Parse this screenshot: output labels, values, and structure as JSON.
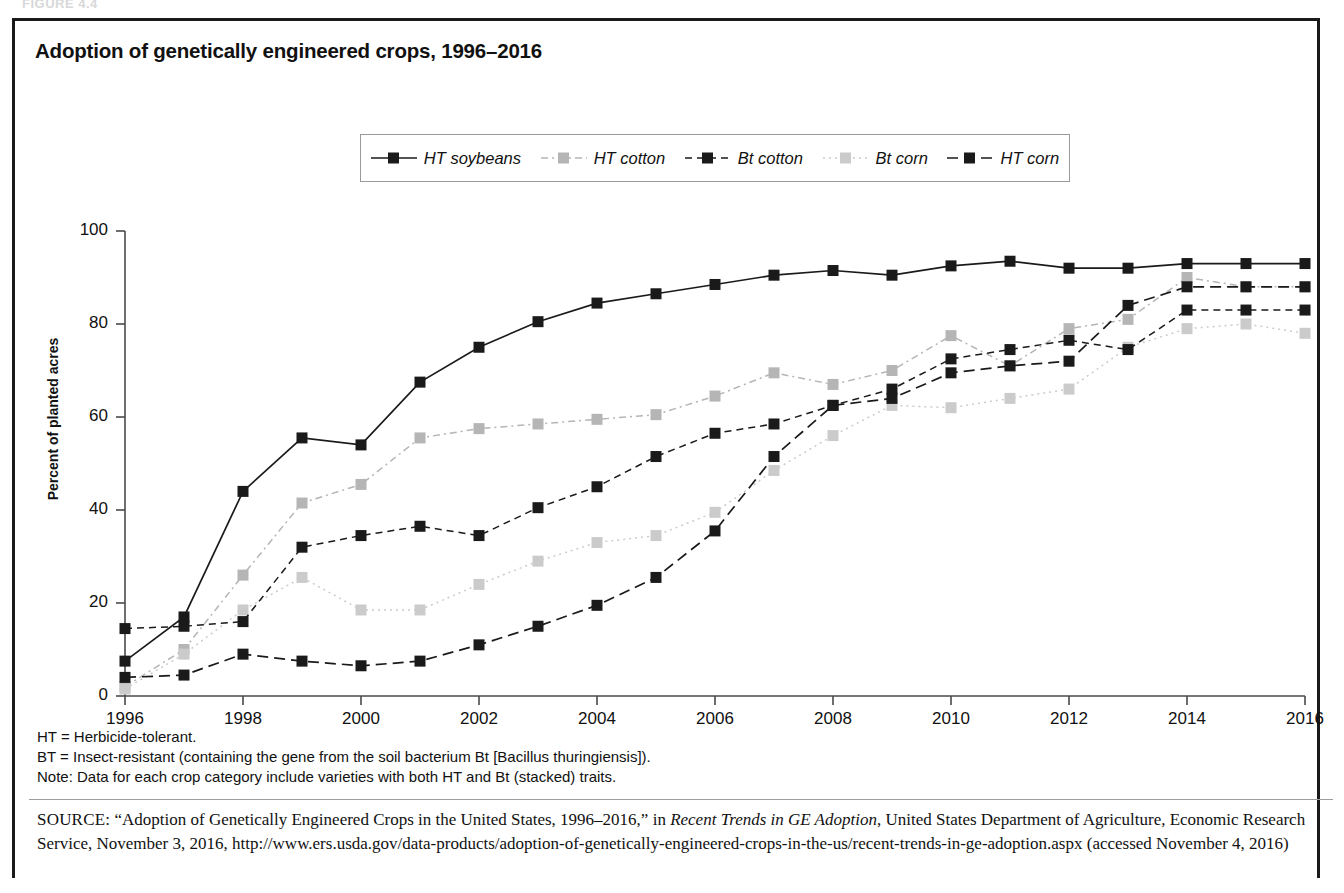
{
  "figure_tag": "FIGURE 4.4",
  "chart_title": "Adoption of genetically engineered crops, 1996–2016",
  "axes": {
    "ylabel": "Percent of planted acres",
    "yticks": [
      "0",
      "20",
      "40",
      "60",
      "80",
      "100"
    ],
    "xticks": [
      "1996",
      "1998",
      "2000",
      "2002",
      "2004",
      "2006",
      "2008",
      "2010",
      "2012",
      "2014",
      "2016"
    ]
  },
  "legend": {
    "items": [
      {
        "label": "HT soybeans",
        "style": "solid-black",
        "color": "#1a1a1a"
      },
      {
        "label": "HT cotton",
        "style": "dashdot-gray",
        "color": "#b5b5b5"
      },
      {
        "label": "Bt cotton",
        "style": "dashed-black",
        "color": "#1a1a1a"
      },
      {
        "label": "Bt corn",
        "style": "dotted-lightgray",
        "color": "#cbcbcb"
      },
      {
        "label": "HT corn",
        "style": "longdash-black",
        "color": "#1a1a1a"
      }
    ]
  },
  "notes": [
    "HT = Herbicide-tolerant.",
    "BT = Insect-resistant (containing the gene from the soil bacterium Bt [Bacillus thuringiensis]).",
    "Note: Data for each crop category include varieties with both HT and Bt (stacked) traits."
  ],
  "source": {
    "prefix": "SOURCE:",
    "part1": " “Adoption of Genetically Engineered Crops in the United States, 1996–2016,” in ",
    "italic": "Recent Trends in GE Adoption",
    "part2": ", United States Department of Agriculture, Economic Research Service, November 3, 2016, http://www.ers.usda.gov/data-products/adoption-of-genetically-engineered-crops-in-the-us/recent-trends-in-ge-adoption.aspx (accessed November 4, 2016)"
  },
  "chart_data": {
    "type": "line",
    "title": "Adoption of genetically engineered crops, 1996–2016",
    "xlabel": "",
    "ylabel": "Percent of planted acres",
    "ylim": [
      0,
      100
    ],
    "xlim": [
      1996,
      2016
    ],
    "grid": false,
    "legend_position": "top-center",
    "x": [
      1996,
      1997,
      1998,
      1999,
      2000,
      2001,
      2002,
      2003,
      2004,
      2005,
      2006,
      2007,
      2008,
      2009,
      2010,
      2011,
      2012,
      2013,
      2014,
      2015,
      2016
    ],
    "series": [
      {
        "name": "HT soybeans",
        "style": "solid-black",
        "color": "#1a1a1a",
        "values": [
          7.5,
          17,
          44,
          55.5,
          54,
          67.5,
          75,
          80.5,
          84.5,
          86.5,
          88.5,
          90.5,
          91.5,
          90.5,
          92.5,
          93.5,
          92,
          92,
          93,
          93,
          93
        ]
      },
      {
        "name": "HT cotton",
        "style": "dashdot-gray",
        "color": "#b5b5b5",
        "values": [
          2,
          10,
          26,
          41.5,
          45.5,
          55.5,
          57.5,
          58.5,
          59.5,
          60.5,
          64.5,
          69.5,
          67,
          70,
          77.5,
          71,
          79,
          81,
          90,
          88,
          88
        ]
      },
      {
        "name": "Bt cotton",
        "style": "dashed-black",
        "color": "#1a1a1a",
        "values": [
          14.5,
          15,
          16,
          32,
          34.5,
          36.5,
          34.5,
          40.5,
          45,
          51.5,
          56.5,
          58.5,
          62.5,
          66,
          72.5,
          74.5,
          76.5,
          74.5,
          83,
          83,
          83
        ]
      },
      {
        "name": "Bt corn",
        "style": "dotted-lightgray",
        "color": "#cbcbcb",
        "values": [
          1.5,
          9,
          18.5,
          25.5,
          18.5,
          18.5,
          24,
          29,
          33,
          34.5,
          39.5,
          48.5,
          56,
          62.5,
          62,
          64,
          66,
          75,
          79,
          80,
          78
        ]
      },
      {
        "name": "HT corn",
        "style": "longdash-black",
        "color": "#1a1a1a",
        "values": [
          4,
          4.5,
          9,
          7.5,
          6.5,
          7.5,
          11,
          15,
          19.5,
          25.5,
          35.5,
          51.5,
          62.5,
          64,
          69.5,
          71,
          72,
          84,
          88,
          88,
          88
        ]
      }
    ]
  }
}
